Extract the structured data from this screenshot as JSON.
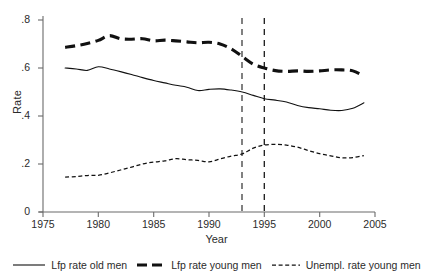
{
  "chart_data": {
    "type": "line",
    "title": "",
    "xlabel": "Year",
    "ylabel": "Rate",
    "xlim": [
      1975,
      2005
    ],
    "ylim": [
      0,
      0.8
    ],
    "xticks": [
      1975,
      1980,
      1985,
      1990,
      1995,
      2000,
      2005
    ],
    "yticks": [
      "0",
      ".2",
      ".4",
      ".6",
      ".8"
    ],
    "ytick_values": [
      0,
      0.2,
      0.4,
      0.6,
      0.8
    ],
    "grid": false,
    "legend_position": "below-axis",
    "x": [
      1977,
      1978,
      1979,
      1980,
      1981,
      1982,
      1983,
      1984,
      1985,
      1986,
      1987,
      1988,
      1989,
      1990,
      1991,
      1992,
      1993,
      1994,
      1995,
      1996,
      1997,
      1998,
      1999,
      2000,
      2001,
      2002,
      2003,
      2004
    ],
    "series": [
      {
        "name": "Lfp rate old men",
        "style": "solid",
        "color": "#111111",
        "values": [
          0.6,
          0.596,
          0.59,
          0.605,
          0.596,
          0.585,
          0.573,
          0.56,
          0.548,
          0.538,
          0.528,
          0.52,
          0.506,
          0.511,
          0.513,
          0.508,
          0.5,
          0.486,
          0.472,
          0.466,
          0.458,
          0.444,
          0.435,
          0.43,
          0.424,
          0.423,
          0.432,
          0.455
        ]
      },
      {
        "name": "Lfp rate young men",
        "style": "dashed-thick",
        "color": "#111111",
        "values": [
          0.686,
          0.693,
          0.702,
          0.715,
          0.735,
          0.722,
          0.72,
          0.722,
          0.713,
          0.716,
          0.713,
          0.709,
          0.705,
          0.707,
          0.7,
          0.68,
          0.648,
          0.616,
          0.6,
          0.589,
          0.586,
          0.588,
          0.586,
          0.588,
          0.592,
          0.592,
          0.588,
          0.566
        ]
      },
      {
        "name": "Unempl. rate young men",
        "style": "dotted",
        "color": "#111111",
        "values": [
          0.145,
          0.148,
          0.152,
          0.153,
          0.163,
          0.175,
          0.187,
          0.2,
          0.208,
          0.213,
          0.222,
          0.218,
          0.215,
          0.209,
          0.221,
          0.233,
          0.242,
          0.266,
          0.279,
          0.282,
          0.279,
          0.27,
          0.256,
          0.243,
          0.234,
          0.226,
          0.227,
          0.235
        ]
      }
    ],
    "reference_lines": [
      {
        "name": "vline-1993",
        "x": 1993,
        "style": "dashed"
      },
      {
        "name": "vline-1995",
        "x": 1995,
        "style": "dashed"
      }
    ]
  },
  "legend": {
    "items": [
      {
        "label": "Lfp rate old men",
        "key": "solid-line-key"
      },
      {
        "label": "Lfp rate young men",
        "key": "thick-dashed-line-key"
      },
      {
        "label": "Unempl. rate young men",
        "key": "dotted-line-key"
      }
    ]
  }
}
